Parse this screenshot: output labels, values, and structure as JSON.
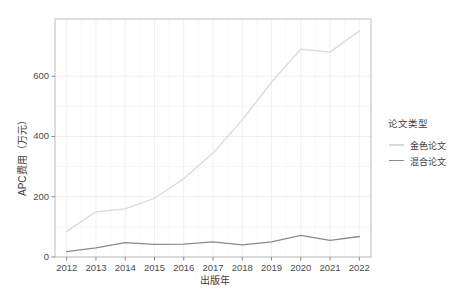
{
  "chart_data": {
    "type": "line",
    "title": "",
    "xlabel": "出版年",
    "ylabel": "APC费用（万元）",
    "x": [
      2012,
      2013,
      2014,
      2015,
      2016,
      2017,
      2018,
      2019,
      2020,
      2021,
      2022
    ],
    "xtick_labels": [
      "2012",
      "2013",
      "2014",
      "2015",
      "2016",
      "2017",
      "2018",
      "2019",
      "2020",
      "2021",
      "2022"
    ],
    "ytick_labels": [
      "0",
      "200",
      "400",
      "600"
    ],
    "ytick_values": [
      0,
      200,
      400,
      600
    ],
    "ylim": [
      0,
      790
    ],
    "xlim": [
      2011.6,
      2022.4
    ],
    "grid": true,
    "legend_position": "right",
    "series": [
      {
        "name": "金色论文",
        "color": "#d9d9d9",
        "values": [
          85,
          150,
          160,
          195,
          260,
          345,
          455,
          580,
          690,
          680,
          750
        ]
      },
      {
        "name": "混合论文",
        "color": "#8a8a8a",
        "values": [
          18,
          30,
          48,
          42,
          43,
          50,
          40,
          50,
          72,
          55,
          68
        ]
      }
    ]
  },
  "legend": {
    "title": "论文类型",
    "entries": [
      {
        "label": "金色论文",
        "color": "#d9d9d9"
      },
      {
        "label": "混合论文",
        "color": "#8a8a8a"
      }
    ]
  },
  "panel": {
    "background": "#ffffff",
    "border_color": "#bdbdbd",
    "gridline_color": "#f0f0f0"
  }
}
